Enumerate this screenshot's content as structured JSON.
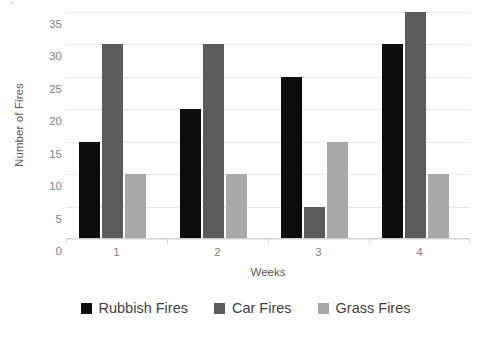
{
  "chart_data": {
    "type": "bar",
    "title": "",
    "xlabel": "Weeks",
    "ylabel": "Number of Fires",
    "categories": [
      "1",
      "2",
      "3",
      "4"
    ],
    "series": [
      {
        "name": "Rubbish Fires",
        "color": "#0d0d0d",
        "values": [
          15,
          20,
          25,
          30
        ]
      },
      {
        "name": "Car Fires",
        "color": "#5b5b5b",
        "values": [
          30,
          30,
          5,
          35
        ]
      },
      {
        "name": "Grass Fires",
        "color": "#a8a8a8",
        "values": [
          10,
          10,
          15,
          10
        ]
      }
    ],
    "ylim": [
      0,
      35
    ],
    "ytick_step": 5,
    "yticks": [
      0,
      5,
      10,
      15,
      20,
      25,
      30,
      35
    ],
    "grid": true,
    "legend_position": "bottom"
  }
}
